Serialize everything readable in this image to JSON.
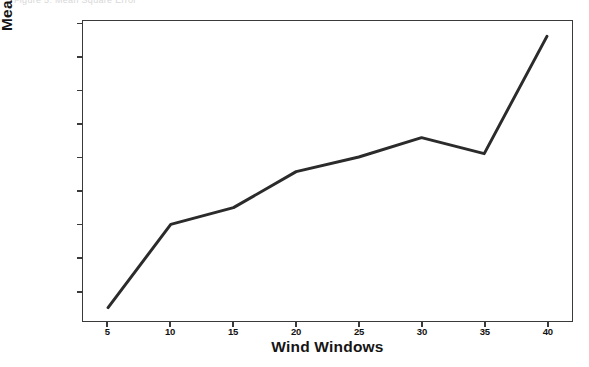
{
  "caption": {
    "text": "Figure 5. Mean Square Error"
  },
  "chart_data": {
    "type": "line",
    "title": "",
    "xlabel": "Wind Windows",
    "ylabel": "Mean Square Error",
    "x": [
      5,
      10,
      15,
      20,
      25,
      30,
      35,
      40
    ],
    "values": [
      15.75,
      17.0,
      17.25,
      17.79,
      18.01,
      18.3,
      18.06,
      19.82
    ],
    "series": [
      {
        "name": "Mean Square Error",
        "values": [
          15.75,
          17.0,
          17.25,
          17.79,
          18.01,
          18.3,
          18.06,
          19.82
        ]
      }
    ],
    "xlim": [
      3.0,
      42.0
    ],
    "ylim": [
      15.55,
      20.05
    ],
    "xticks": [
      5,
      10,
      15,
      20,
      25,
      30,
      35,
      40
    ],
    "xticklabels": [
      "5",
      "10",
      "15",
      "20",
      "25",
      "30",
      "35",
      "40"
    ],
    "yticks": [
      16.0,
      16.5,
      17.0,
      17.5,
      18.0,
      18.5,
      19.0,
      19.5,
      20.0
    ],
    "yticklabels": [
      "16.0",
      "16.5",
      "17.0",
      "17.5",
      "18.0",
      "18.5",
      "19.0",
      "19.5",
      "20.0"
    ],
    "grid": false,
    "legend": null,
    "line_color": "#2b2b2b",
    "line_width": 3,
    "background_color": "#ffffff",
    "axes_color": "#3a3a3a"
  }
}
